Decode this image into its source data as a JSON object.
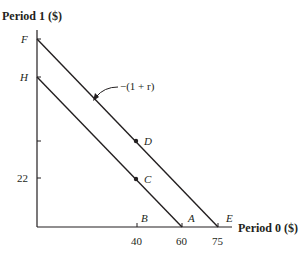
{
  "diagram": {
    "type": "intertemporal-budget-lines",
    "y_axis_title": "Period 1 ($)",
    "x_axis_title": "Period 0 ($)",
    "y_ticks": [
      {
        "label": "F",
        "italic": true
      },
      {
        "label": "H",
        "italic": true
      },
      {
        "label": ""
      },
      {
        "label": "22"
      }
    ],
    "x_ticks": [
      {
        "value": "40",
        "point": "B"
      },
      {
        "value": "60",
        "point": "A"
      },
      {
        "value": "75",
        "point": "E"
      }
    ],
    "lines": [
      {
        "name": "inner-budget-line",
        "from": "H",
        "to": "A"
      },
      {
        "name": "outer-budget-line",
        "from": "F",
        "to": "E"
      }
    ],
    "points": [
      {
        "label": "C",
        "on": "inner-budget-line",
        "x": "40",
        "y": "22"
      },
      {
        "label": "D",
        "on": "outer-budget-line",
        "x": "40"
      }
    ],
    "slope_annotation": "−(1 + r)",
    "colors": {
      "ink": "#231f20",
      "background": "#ffffff"
    }
  }
}
